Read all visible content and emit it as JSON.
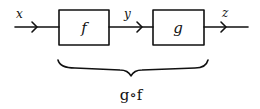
{
  "diagram": {
    "input_label": "x",
    "intermediate_label": "y",
    "output_label": "z",
    "blocks": [
      {
        "label": "f"
      },
      {
        "label": "g"
      }
    ],
    "composition_label": "g∘f",
    "stroke_color": "#111111",
    "background": "#ffffff"
  }
}
